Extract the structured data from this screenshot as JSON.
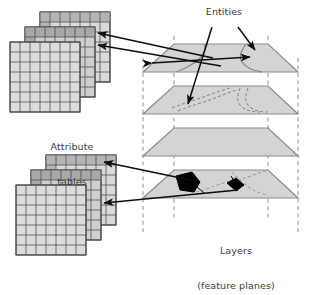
{
  "figure": {
    "name": "gis-layers-and-attribute-tables",
    "background_color": "#ffffff"
  },
  "labels": {
    "entities": "Entities",
    "attribute_tables_line1": "Attribute",
    "attribute_tables_line2": "tables",
    "layers_line1": "Layers",
    "layers_line2": "(feature planes)"
  },
  "colors": {
    "plane_fill": "#d4d4d4",
    "plane_edge": "#8c8c8c",
    "plane_edge_dark": "#6e6e6e",
    "table_fill_light": "#d9d9d9",
    "table_fill_mid": "#c2c2c2",
    "table_fill_dark": "#a8a8a8",
    "table_grid": "#4a4a4a",
    "table_border": "#3d3d3d",
    "arrow": "#0d0d0d",
    "feature_line": "#8a8a8a",
    "feature_dashed": "#8a8a8a",
    "polygon_fill": "#000000",
    "guide_dash": "#9a9a9a",
    "text": "#3b3b3b"
  },
  "table_stacks": [
    {
      "name": "upper-attribute-table-stack",
      "position": "top-left",
      "linked_layer": "top feature plane",
      "tables": [
        {
          "name": "table-back",
          "columns": 7,
          "rows": 7,
          "header_row_shaded": true,
          "first_column_shaded": true,
          "fill": "#d9d9d9"
        },
        {
          "name": "table-middle",
          "columns": 7,
          "rows": 7,
          "header_row_shaded": true,
          "first_column_shaded": true,
          "fill": "#c2c2c2"
        },
        {
          "name": "table-front",
          "columns": 7,
          "rows": 7,
          "header_row_shaded": false,
          "first_column_shaded": false,
          "fill": "#d9d9d9"
        }
      ]
    },
    {
      "name": "lower-attribute-table-stack",
      "position": "bottom-left",
      "linked_layer": "bottom feature plane",
      "tables": [
        {
          "name": "table-back",
          "columns": 7,
          "rows": 7,
          "header_row_shaded": true,
          "first_column_shaded": true,
          "fill": "#d9d9d9"
        },
        {
          "name": "table-middle",
          "columns": 7,
          "rows": 7,
          "header_row_shaded": true,
          "first_column_shaded": true,
          "fill": "#c2c2c2"
        },
        {
          "name": "table-front",
          "columns": 7,
          "rows": 7,
          "header_row_shaded": false,
          "first_column_shaded": false,
          "fill": "#d9d9d9"
        }
      ]
    }
  ],
  "layers": [
    {
      "index": 1,
      "name": "feature-plane-1",
      "position": "top",
      "content": "curved solid boundary lines (linear entities)",
      "features": [
        "curved-line-left",
        "curved-line-right"
      ],
      "has_polygons": false
    },
    {
      "index": 2,
      "name": "feature-plane-2",
      "position": "upper-middle",
      "content": "dashed contour lines",
      "features": [
        "dashed-contour-left",
        "dashed-contour-right"
      ],
      "has_polygons": false
    },
    {
      "index": 3,
      "name": "feature-plane-3",
      "position": "lower-middle",
      "content": "empty plane",
      "features": [],
      "has_polygons": false
    },
    {
      "index": 4,
      "name": "feature-plane-4",
      "position": "bottom",
      "content": "two filled black polygon entities with dashed boundaries",
      "features": [
        "black-polygon-large",
        "black-polygon-small",
        "dashed-boundary"
      ],
      "has_polygons": true
    }
  ],
  "connectors": [
    {
      "name": "arrow-plane1-to-upper-table-a",
      "from": "feature-plane-1",
      "to": "upper-attribute-table-stack",
      "style": "single-headed"
    },
    {
      "name": "arrow-plane1-to-upper-table-b",
      "from": "feature-plane-1",
      "to": "upper-attribute-table-stack",
      "style": "single-headed"
    },
    {
      "name": "arrow-entity-double-headed",
      "from": "feature-plane-1-left",
      "to": "feature-plane-1-right",
      "style": "double-headed"
    },
    {
      "name": "arrow-entities-label-to-plane1",
      "from": "entities-label",
      "to": "feature-plane-1",
      "style": "single-headed"
    },
    {
      "name": "arrow-entities-label-to-plane2",
      "from": "entities-label",
      "to": "feature-plane-2",
      "style": "single-headed"
    },
    {
      "name": "arrow-plane4-polygon-to-lower-table-a",
      "from": "feature-plane-4",
      "to": "lower-attribute-table-stack",
      "style": "single-headed"
    },
    {
      "name": "arrow-plane4-polygon-to-lower-table-b",
      "from": "feature-plane-4",
      "to": "lower-attribute-table-stack",
      "style": "single-headed"
    }
  ],
  "guides": {
    "name": "vertical-dashed-guides",
    "count": 4,
    "description": "dashed vertical lines connecting plane corners top to bottom"
  }
}
